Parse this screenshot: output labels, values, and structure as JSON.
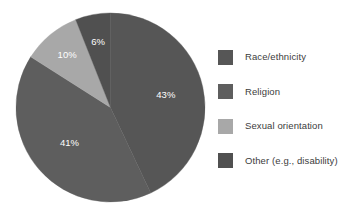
{
  "chart_data": {
    "type": "pie",
    "title": "",
    "subtitle": "",
    "xlabel": "",
    "ylabel": "",
    "grid": false,
    "legend_position": "right",
    "start_angle_deg": 0,
    "direction": "clockwise",
    "categories": [
      "Race/ethnicity",
      "Religion",
      "Sexual orientation",
      "Other (e.g., disability)"
    ],
    "values": [
      43,
      41,
      10,
      6
    ],
    "value_unit": "%",
    "data_labels": [
      "43%",
      "41%",
      "10%",
      "6%"
    ],
    "colors": [
      "#565656",
      "#5e5e5e",
      "#a8a8a8",
      "#505050"
    ],
    "slices": [
      {
        "label": "Race/ethnicity",
        "value": 43,
        "data_label": "43%",
        "color": "#565656",
        "start_deg": 0,
        "end_deg": 154.8
      },
      {
        "label": "Religion",
        "value": 41,
        "data_label": "41%",
        "color": "#5e5e5e",
        "start_deg": 154.8,
        "end_deg": 302.4
      },
      {
        "label": "Sexual orientation",
        "value": 10,
        "data_label": "10%",
        "color": "#a8a8a8",
        "start_deg": 302.4,
        "end_deg": 338.4
      },
      {
        "label": "Other (e.g., disability)",
        "value": 6,
        "data_label": "6%",
        "color": "#505050",
        "start_deg": 338.4,
        "end_deg": 360
      }
    ]
  },
  "legend": {
    "items": [
      {
        "label": "Race/ethnicity",
        "color": "#565656"
      },
      {
        "label": "Religion",
        "color": "#5e5e5e"
      },
      {
        "label": "Sexual orientation",
        "color": "#a8a8a8"
      },
      {
        "label": "Other (e.g., disability)",
        "color": "#505050"
      }
    ]
  },
  "colors": {
    "background": "#ffffff",
    "label_text": "#ffffff",
    "legend_text": "#3c3c3c"
  }
}
